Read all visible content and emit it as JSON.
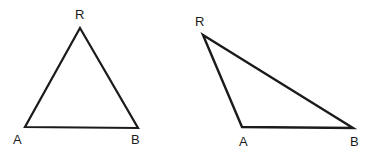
{
  "figure": {
    "background_color": "#ffffff",
    "stroke_color": "#1b1b1b",
    "label_color": "#1b1b1b",
    "width": 380,
    "height": 158
  },
  "shapes": [
    {
      "id": "triangle-left",
      "name": "left-triangle",
      "kind": "triangle",
      "stroke_width": 2.2,
      "vertices": [
        {
          "label": "R",
          "x": 80,
          "y": 28
        },
        {
          "label": "B",
          "x": 138,
          "y": 128
        },
        {
          "label": "A",
          "x": 25,
          "y": 127
        }
      ],
      "path": "M 80,28 L 138,128 L 25,127 Z"
    },
    {
      "id": "triangle-right",
      "name": "right-triangle",
      "kind": "triangle",
      "stroke_width": 2.4,
      "vertices": [
        {
          "label": "R",
          "x": 203,
          "y": 35
        },
        {
          "label": "B",
          "x": 353,
          "y": 128
        },
        {
          "label": "A",
          "x": 242,
          "y": 127
        }
      ],
      "path": "M 203,35 L 353,128 L 242,127 Z"
    }
  ],
  "labels": [
    {
      "id": "label-left-R",
      "text": "R",
      "x": 75,
      "y": 8,
      "shape": "left-triangle",
      "vertex": "R"
    },
    {
      "id": "label-left-A",
      "text": "A",
      "x": 13,
      "y": 133,
      "shape": "left-triangle",
      "vertex": "A"
    },
    {
      "id": "label-left-B",
      "text": "B",
      "x": 131,
      "y": 133,
      "shape": "left-triangle",
      "vertex": "B"
    },
    {
      "id": "label-right-R",
      "text": "R",
      "x": 195,
      "y": 15,
      "shape": "right-triangle",
      "vertex": "R"
    },
    {
      "id": "label-right-A",
      "text": "A",
      "x": 239,
      "y": 135,
      "shape": "right-triangle",
      "vertex": "A"
    },
    {
      "id": "label-right-B",
      "text": "B",
      "x": 350,
      "y": 135,
      "shape": "right-triangle",
      "vertex": "B"
    }
  ]
}
